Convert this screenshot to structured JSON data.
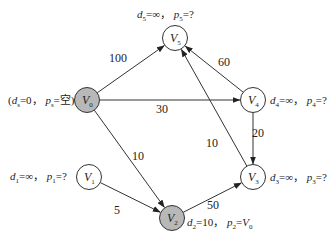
{
  "diagram": {
    "type": "directed-weighted-graph",
    "colors": {
      "visited_fill": "#b8b8b8",
      "unvisited_fill": "#ffffff",
      "stroke": "#333333",
      "text": "#222222"
    },
    "nodes": [
      {
        "id": "V0",
        "letter": "V",
        "sub": "0",
        "visited": true,
        "annotation": {
          "prefix": "(",
          "d_sub": "s",
          "d_val": "0",
          "p_sub": "s",
          "p_val": "空",
          "suffix": ")"
        }
      },
      {
        "id": "V1",
        "letter": "V",
        "sub": "1",
        "visited": false,
        "annotation": {
          "prefix": "",
          "d_sub": "1",
          "d_val": "∞",
          "p_sub": "1",
          "p_val": "?",
          "suffix": ""
        }
      },
      {
        "id": "V2",
        "letter": "V",
        "sub": "2",
        "visited": true,
        "annotation": {
          "prefix": "",
          "d_sub": "2",
          "d_val": "10",
          "p_sub": "2",
          "p_val": "V",
          "p_val_sub": "0",
          "suffix": ""
        }
      },
      {
        "id": "V3",
        "letter": "V",
        "sub": "3",
        "visited": false,
        "annotation": {
          "prefix": "",
          "d_sub": "3",
          "d_val": "∞",
          "p_sub": "3",
          "p_val": "?",
          "suffix": ""
        }
      },
      {
        "id": "V4",
        "letter": "V",
        "sub": "4",
        "visited": false,
        "annotation": {
          "prefix": "",
          "d_sub": "4",
          "d_val": "∞",
          "p_sub": "4",
          "p_val": "?",
          "suffix": ""
        }
      },
      {
        "id": "V5",
        "letter": "V",
        "sub": "5",
        "visited": false,
        "annotation": {
          "prefix": "",
          "d_sub": "5",
          "d_val": "∞",
          "p_sub": "5",
          "p_val": "?",
          "suffix": ""
        }
      }
    ],
    "edges": [
      {
        "from": "V0",
        "to": "V5",
        "weight": "100"
      },
      {
        "from": "V0",
        "to": "V4",
        "weight": "30"
      },
      {
        "from": "V0",
        "to": "V2",
        "weight": "10"
      },
      {
        "from": "V4",
        "to": "V5",
        "weight": "60"
      },
      {
        "from": "V4",
        "to": "V3",
        "weight": "20"
      },
      {
        "from": "V3",
        "to": "V5",
        "weight": "10"
      },
      {
        "from": "V1",
        "to": "V2",
        "weight": "5"
      },
      {
        "from": "V2",
        "to": "V3",
        "weight": "50"
      }
    ],
    "labels": {
      "d": "d",
      "p": "p",
      "eq": "=",
      "sep": "，"
    }
  }
}
